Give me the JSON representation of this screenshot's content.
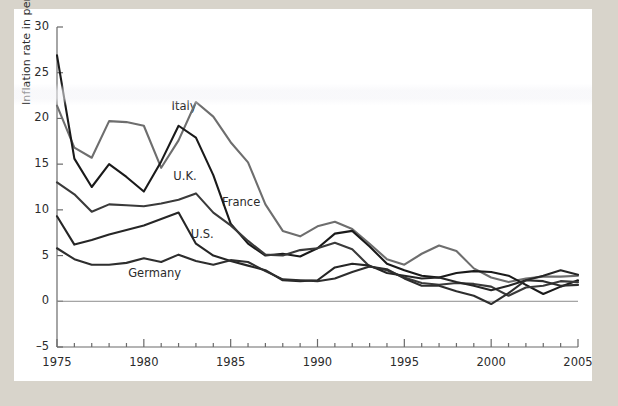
{
  "figure": {
    "background": "#ffffff",
    "page_background": "#d8d4cb"
  },
  "chart_data": {
    "type": "line",
    "title": "",
    "subtitle": "",
    "xlabel": "",
    "ylabel": "Inflation rate in percent",
    "xlim": [
      1975,
      2005
    ],
    "ylim": [
      -5,
      30
    ],
    "grid": false,
    "legend_position": "inline-annotations",
    "x_major_ticks": [
      1975,
      1980,
      1985,
      1990,
      1995,
      2000,
      2005
    ],
    "x_major_tick_labels": [
      "1975",
      "1980",
      "1985",
      "1990",
      "1995",
      "2000",
      "2005"
    ],
    "x_minor_tick_step": 1,
    "y_ticks": [
      -5,
      0,
      5,
      10,
      15,
      20,
      25,
      30
    ],
    "y_tick_labels": [
      "–5",
      "0",
      "5",
      "10",
      "15",
      "20",
      "25",
      "30"
    ],
    "zero_line": 0,
    "x": [
      1975,
      1976,
      1977,
      1978,
      1979,
      1980,
      1981,
      1982,
      1983,
      1984,
      1985,
      1986,
      1987,
      1988,
      1989,
      1990,
      1991,
      1992,
      1993,
      1994,
      1995,
      1996,
      1997,
      1998,
      1999,
      2000,
      2001,
      2002,
      2003,
      2004,
      2005
    ],
    "series": [
      {
        "name": "Italy",
        "color": "#6e6e6e",
        "label_x": 1981.6,
        "label_y": 21.3,
        "values": [
          21.4,
          16.8,
          15.7,
          19.7,
          19.6,
          19.2,
          14.6,
          17.6,
          21.8,
          20.2,
          17.4,
          15.2,
          10.6,
          7.7,
          7.1,
          8.2,
          8.7,
          7.9,
          6.3,
          4.6,
          4.0,
          5.2,
          6.1,
          5.5,
          3.6,
          2.6,
          2.1,
          2.5,
          2.7,
          2.7,
          2.8
        ]
      },
      {
        "name": "U.K.",
        "color": "#1a1a1a",
        "label_x": 1981.7,
        "label_y": 13.6,
        "values": [
          26.9,
          15.6,
          12.5,
          15.0,
          13.6,
          12.0,
          15.3,
          19.2,
          17.9,
          13.8,
          8.5,
          6.3,
          5.0,
          5.2,
          4.9,
          5.8,
          7.4,
          7.7,
          6.0,
          4.1,
          3.4,
          2.8,
          2.6,
          3.1,
          3.3,
          3.2,
          2.8,
          1.8,
          0.8,
          1.6,
          2.3
        ]
      },
      {
        "name": "France",
        "color": "#3a3a3a",
        "label_x": 1984.5,
        "label_y": 10.8,
        "values": [
          13.0,
          11.7,
          9.8,
          10.6,
          10.5,
          10.4,
          10.7,
          11.1,
          11.8,
          9.7,
          8.3,
          6.6,
          5.1,
          5.0,
          5.6,
          5.8,
          6.4,
          5.7,
          3.8,
          3.4,
          2.6,
          2.0,
          1.8,
          2.0,
          1.9,
          1.6,
          0.6,
          1.5,
          1.7,
          2.2,
          2.1
        ]
      },
      {
        "name": "U.S.",
        "color": "#262626",
        "label_x": 1982.7,
        "label_y": 7.3,
        "values": [
          9.3,
          6.2,
          6.7,
          7.3,
          7.8,
          8.3,
          9.0,
          9.7,
          6.3,
          5.0,
          4.4,
          3.9,
          3.4,
          2.3,
          2.2,
          2.3,
          3.7,
          4.1,
          3.9,
          3.1,
          2.8,
          2.5,
          2.6,
          2.1,
          1.7,
          1.2,
          1.7,
          2.3,
          2.8,
          3.4,
          2.9
        ]
      },
      {
        "name": "Germany",
        "color": "#2e2e2e",
        "label_x": 1979.1,
        "label_y": 3.0,
        "values": [
          5.8,
          4.6,
          4.0,
          4.0,
          4.2,
          4.7,
          4.3,
          5.1,
          4.4,
          4.0,
          4.5,
          4.3,
          3.3,
          2.4,
          2.3,
          2.2,
          2.5,
          3.2,
          3.8,
          3.5,
          2.5,
          1.7,
          1.7,
          1.1,
          0.6,
          -0.3,
          0.9,
          2.3,
          2.2,
          1.7,
          1.8
        ]
      }
    ]
  }
}
